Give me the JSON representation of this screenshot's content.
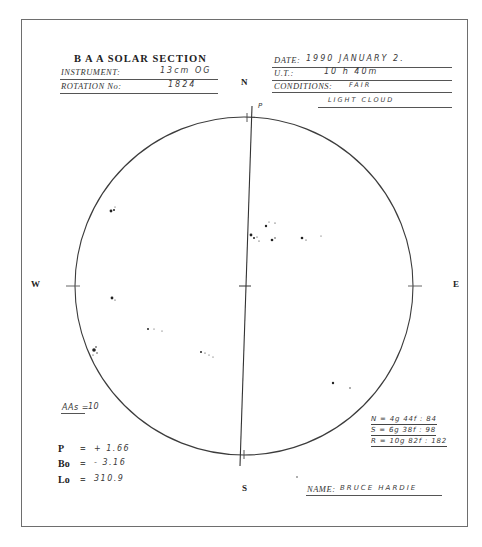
{
  "form": {
    "title": "B A A  SOLAR SECTION",
    "instrument_label": "INSTRUMENT:",
    "instrument_value": "13cm OG",
    "rotation_label": "ROTATION No:",
    "rotation_value": "1824",
    "date_label": "DATE:",
    "date_value": "1990  JANUARY  2.",
    "ut_label": "U.T.:",
    "ut_value": "10 h 40m",
    "conditions_label": "CONDITIONS:",
    "conditions_value": "FAIR",
    "conditions_value_2": "LIGHT CLOUD",
    "name_label": "NAME:",
    "name_value": "BRUCE HARDIE"
  },
  "compass": {
    "north": "N",
    "south": "S",
    "west": "W",
    "east": "E",
    "p_axis_label": "P"
  },
  "sunspot_counts": {
    "aas_label": "AAs =",
    "aas_value": "10",
    "north": "N = 4g 44f : 84",
    "south": "S = 6g 38f : 98",
    "total": "R = 10g 82f : 182"
  },
  "ephemeris": {
    "p_label": "P",
    "p_value": "+ 1.66",
    "bo_label": "Bo",
    "bo_value": "- 3.16",
    "lo_label": "Lo",
    "lo_value": "310.9",
    "equals": "="
  },
  "disk": {
    "center_x": 244,
    "center_y": 286,
    "radius": 169,
    "outline_color": "#3c3c3c"
  }
}
